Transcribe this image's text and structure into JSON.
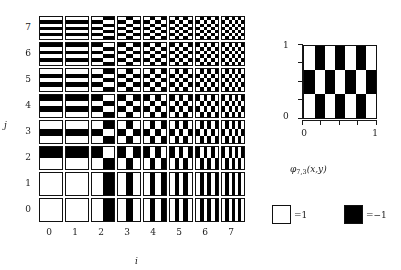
{
  "figure": {
    "title": "",
    "background": "#ffffff",
    "ink": "#1a1a1a"
  },
  "grid_panel": {
    "x_axis_label": "i",
    "y_axis_label": "j",
    "x_ticks": [
      "0",
      "1",
      "2",
      "3",
      "4",
      "5",
      "6",
      "7"
    ],
    "y_ticks": [
      "0",
      "1",
      "2",
      "3",
      "4",
      "5",
      "6",
      "7"
    ]
  },
  "detail_panel": {
    "caption_main": "φ",
    "caption_sub": "7,3",
    "caption_args": "(x,y)",
    "y_tick_top": "1",
    "y_tick_bottom": "0",
    "x_tick_left": "0",
    "x_tick_right": "1",
    "i": 7,
    "j": 3
  },
  "legend": {
    "items": [
      {
        "name": "white-swatch",
        "fill": "#ffffff",
        "label": "=1"
      },
      {
        "name": "black-swatch",
        "fill": "#000000",
        "label": "=−1"
      }
    ]
  },
  "chart_data": {
    "type": "heatmap",
    "title": "",
    "xlabel": "i",
    "ylabel": "j",
    "categories_x": [
      0,
      1,
      2,
      3,
      4,
      5,
      6,
      7
    ],
    "categories_y": [
      0,
      1,
      2,
      3,
      4,
      5,
      6,
      7
    ],
    "xlim": [
      0,
      1
    ],
    "ylim": [
      0,
      1
    ],
    "grid": false,
    "legend_position": "bottom-right",
    "value_map": {
      "white": 1,
      "black": -1
    },
    "cell_rule": "sign(sin(i*pi*x)) * sign(sin(j*pi*y)), with sign(0)=+1 so index 0 is uniformly +1",
    "detail_cell": {
      "i": 7,
      "j": 3,
      "xlim": [
        0,
        1
      ],
      "ylim": [
        0,
        1
      ]
    }
  }
}
